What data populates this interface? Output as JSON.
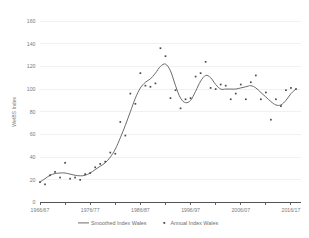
{
  "chart_data": {
    "type": "line",
    "title": "",
    "xlabel": "",
    "ylabel": "WelBS Index",
    "ylim": [
      0,
      160
    ],
    "ytick_values": [
      0,
      20,
      40,
      60,
      80,
      100,
      120,
      140,
      160
    ],
    "ytick_labels": [
      "0",
      "20",
      "40",
      "60",
      "80",
      "100",
      "120",
      "140",
      "160"
    ],
    "xtick_labels": [
      "1966/67",
      "1976/77",
      "1986/87",
      "1996/97",
      "2006/07",
      "2016/17"
    ],
    "xtick_years": [
      1966,
      1976,
      1986,
      1996,
      2006,
      2016
    ],
    "xlim": [
      1966,
      2018
    ],
    "minor_tick_years": [
      1966,
      1971,
      1976,
      1981,
      1986,
      1991,
      1996,
      2001,
      2006,
      2011,
      2016
    ],
    "grid": "horizontal",
    "legend_position": "bottom",
    "legend": [
      {
        "label": "Smoothed Index Wales",
        "marker": "line",
        "color": "#6b6b6b"
      },
      {
        "label": "Annual Index Wales",
        "marker": "dot",
        "color": "#4a4a4a"
      }
    ],
    "x": [
      1966,
      1967,
      1968,
      1969,
      1970,
      1971,
      1972,
      1973,
      1974,
      1975,
      1976,
      1977,
      1978,
      1979,
      1980,
      1981,
      1982,
      1983,
      1984,
      1985,
      1986,
      1987,
      1988,
      1989,
      1990,
      1991,
      1992,
      1993,
      1994,
      1995,
      1996,
      1997,
      1998,
      1999,
      2000,
      2001,
      2002,
      2003,
      2004,
      2005,
      2006,
      2007,
      2008,
      2009,
      2010,
      2011,
      2012,
      2013,
      2014,
      2015,
      2016,
      2017
    ],
    "series": [
      {
        "name": "Annual Index Wales",
        "type": "scatter",
        "color": "#4a4a4a",
        "values": [
          18,
          16,
          24,
          27,
          22,
          35,
          21,
          22,
          20,
          25,
          26,
          31,
          34,
          36,
          44,
          43,
          71,
          59,
          96,
          87,
          114,
          103,
          102,
          105,
          136,
          129,
          92,
          99,
          83,
          91,
          92,
          111,
          114,
          124,
          101,
          100,
          104,
          103,
          91,
          96,
          104,
          91,
          106,
          112,
          91,
          97,
          73,
          91,
          85,
          99,
          101,
          100
        ]
      },
      {
        "name": "Smoothed Index Wales",
        "type": "line",
        "color": "#6b6b6b",
        "values": [
          18,
          21,
          24,
          25.5,
          26,
          26,
          25,
          24,
          23.5,
          24,
          26,
          29,
          32,
          35,
          40,
          47,
          57,
          68,
          80,
          92,
          101,
          106,
          109,
          114,
          120,
          122,
          116,
          103,
          92,
          88,
          90,
          98,
          107,
          112,
          110,
          104,
          100,
          100,
          100,
          100,
          101,
          102,
          103,
          101,
          97,
          93,
          89,
          86,
          86,
          90,
          96,
          100
        ]
      }
    ]
  }
}
